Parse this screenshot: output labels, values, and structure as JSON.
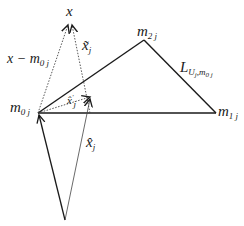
{
  "diagram": {
    "type": "geometric-vector-diagram",
    "colors": {
      "line": "#1a1a1a",
      "thin": "#444444",
      "background": "#ffffff"
    },
    "points": {
      "m0j": {
        "x": 38,
        "y": 113
      },
      "m1j": {
        "x": 216,
        "y": 113
      },
      "m2j": {
        "x": 144,
        "y": 40
      },
      "x": {
        "x": 70,
        "y": 23
      },
      "origin": {
        "x": 65,
        "y": 220
      },
      "xhat_prime_tip": {
        "x": 90,
        "y": 97
      },
      "xtilde_foot": {
        "x": 90,
        "y": 113
      }
    },
    "labels": {
      "x": {
        "main": "x"
      },
      "x_minus_m0j": {
        "main": "x − m",
        "sub": "0 j"
      },
      "x_tilde_j": {
        "main": "x̃",
        "sub": "j"
      },
      "m2j": {
        "main": "m",
        "sub": "2 j"
      },
      "L": {
        "main": "L",
        "sub": "U",
        "subsub": "j",
        "sub2": ",m",
        "subsub2": "0 j"
      },
      "m0j": {
        "main": "m",
        "sub": "0 j"
      },
      "x_hat_prime_j": {
        "main": "x̂",
        "sup": "'",
        "sub": "j"
      },
      "m1j": {
        "main": "m",
        "sub": "1 j"
      },
      "x_hat_j": {
        "main": "x̂",
        "sub": "j"
      }
    }
  }
}
